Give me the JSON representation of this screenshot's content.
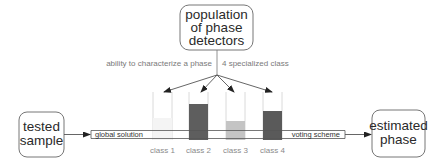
{
  "nodes": {
    "population": {
      "line1": "population",
      "line2": "of phase",
      "line3": "detectors"
    },
    "tested_sample": {
      "line1": "tested",
      "line2": "sample"
    },
    "estimated_phase": {
      "line1": "estimated",
      "line2": "phase"
    }
  },
  "annotations": {
    "left": "ability to characterize a phase",
    "right": "4 specialized class"
  },
  "band": {
    "left_label": "global solution",
    "right_label": "voting scheme"
  },
  "classes": [
    {
      "label": "class 1",
      "fill_color": "#f2f2f2",
      "fill_level": 0.0
    },
    {
      "label": "class 2",
      "fill_color": "#5e5e5e",
      "fill_level": 0.75
    },
    {
      "label": "class 3",
      "fill_color": "#c4c4c4",
      "fill_level": 0.4
    },
    {
      "label": "class 4",
      "fill_color": "#5a5a5a",
      "fill_level": 0.6
    }
  ],
  "colors": {
    "stroke": "#555555",
    "outline_light": "#cfcfcf",
    "arrow": "#333333"
  }
}
